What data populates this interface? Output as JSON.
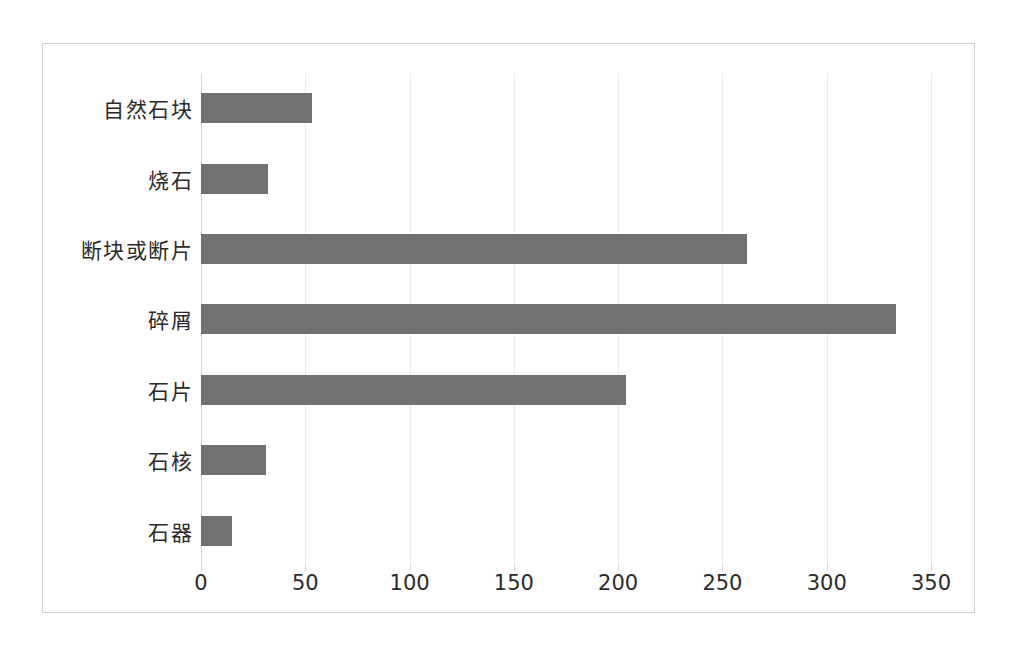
{
  "chart_data": {
    "type": "bar",
    "orientation": "horizontal",
    "title": "",
    "subtitle": "",
    "xlabel": "",
    "ylabel": "",
    "categories": [
      "自然石块",
      "烧石",
      "断块或断片",
      "碎屑",
      "石片",
      "石核",
      "石器"
    ],
    "values": [
      53,
      32,
      262,
      333,
      204,
      31,
      15
    ],
    "series": [
      {
        "name": "",
        "values": [
          53,
          32,
          262,
          333,
          204,
          31,
          15
        ]
      }
    ],
    "xlim": [
      0,
      350
    ],
    "xticks": [
      0,
      50,
      100,
      150,
      200,
      250,
      300,
      350
    ],
    "xtick_labels": [
      "0",
      "50",
      "100",
      "150",
      "200",
      "250",
      "300",
      "350"
    ],
    "grid": "vertical",
    "legend": "none",
    "bar_color": "#717171",
    "gridline_color": "#e9e9e9",
    "axis_color": "#d5d5d5",
    "frame_color": "#d0d0d0",
    "background_color": "#ffffff",
    "text_color": "#2b2b2b",
    "data_labels": "none"
  }
}
